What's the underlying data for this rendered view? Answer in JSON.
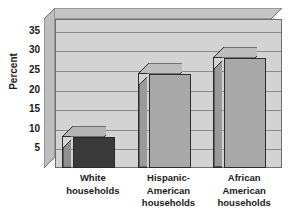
{
  "chart_data": {
    "type": "bar",
    "title": "",
    "subtitle": "",
    "xlabel": "",
    "ylabel": "Percent",
    "categories": [
      "White\nhouseholds",
      "Hispanic-\nAmerican\nhouseholds",
      "African\nAmerican\nhouseholds"
    ],
    "values": [
      8,
      24,
      28
    ],
    "ylim": [
      0,
      38
    ],
    "yticks": [
      5,
      10,
      15,
      20,
      25,
      30,
      35
    ],
    "ytick_labels": [
      "5",
      "10",
      "15",
      "20",
      "25",
      "30",
      "35"
    ],
    "grid": true,
    "legend": false,
    "style": "3d-bar",
    "bar_colors": [
      "#3a3a3a",
      "#a8a8a8",
      "#a8a8a8"
    ],
    "plot_background": "#d3d3d3",
    "axis_color": "#6e6e6e",
    "gridline_color": "#8a8a8a",
    "text_color": "#1a1a1a",
    "series": [
      {
        "name": "Percent",
        "values": [
          8,
          24,
          28
        ]
      }
    ]
  },
  "axis": {
    "y_title": "Percent",
    "ticks": [
      {
        "label": "35",
        "value": 35
      },
      {
        "label": "30",
        "value": 30
      },
      {
        "label": "25",
        "value": 25
      },
      {
        "label": "20",
        "value": 20
      },
      {
        "label": "15",
        "value": 15
      },
      {
        "label": "10",
        "value": 10
      },
      {
        "label": "5",
        "value": 5
      }
    ]
  },
  "bars": [
    {
      "label": "White\nhouseholds",
      "value": 8,
      "color": "#3a3a3a",
      "top_color": "#b4b4b4",
      "side_color": "#8f8f8f"
    },
    {
      "label": "Hispanic-\nAmerican\nhouseholds",
      "value": 24,
      "color": "#a8a8a8",
      "top_color": "#bdbdbd",
      "side_color": "#9a9a9a"
    },
    {
      "label": "African\nAmerican\nhouseholds",
      "value": 28,
      "color": "#a8a8a8",
      "top_color": "#bdbdbd",
      "side_color": "#9a9a9a"
    }
  ]
}
